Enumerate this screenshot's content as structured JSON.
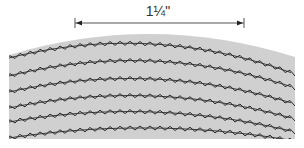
{
  "dimension": {
    "label": "1¼\"",
    "x_start": 75,
    "x_end": 244,
    "y": 23
  },
  "fabric": {
    "fill": "#d0d0d0",
    "stitch_color": "#2a2a2a",
    "left": 9,
    "right": 295,
    "top_left_y": 55,
    "top_peak_y": 34,
    "top_right_y": 57,
    "bottom_y": 139
  },
  "stitch_rows": [
    {
      "y_left": 58,
      "y_mid": 44,
      "y_right": 74
    },
    {
      "y_left": 76,
      "y_mid": 61,
      "y_right": 88
    },
    {
      "y_left": 92,
      "y_mid": 79,
      "y_right": 104
    },
    {
      "y_left": 108,
      "y_mid": 96,
      "y_right": 119
    },
    {
      "y_left": 122,
      "y_mid": 112,
      "y_right": 132
    },
    {
      "y_left": 138,
      "y_mid": 128,
      "y_right": 141
    }
  ],
  "stitch": {
    "period": 10,
    "amplitude": 4
  }
}
